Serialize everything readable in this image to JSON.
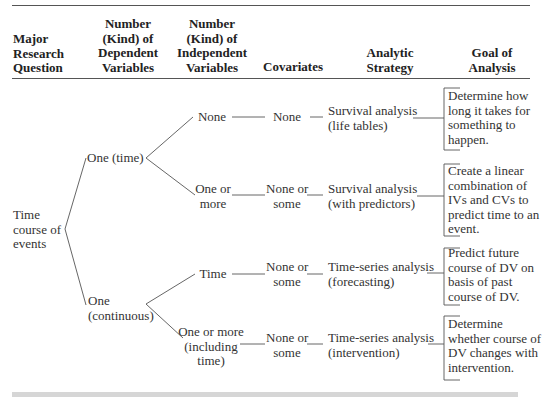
{
  "headers": {
    "question": [
      "Major",
      "Research",
      "Question"
    ],
    "dv": [
      "Number",
      "(Kind) of",
      "Dependent",
      "Variables"
    ],
    "iv": [
      "Number",
      "(Kind) of",
      "Independent",
      "Variables"
    ],
    "covariates": [
      "Covariates"
    ],
    "strategy": [
      "Analytic",
      "Strategy"
    ],
    "goal": [
      "Goal of",
      "Analysis"
    ]
  },
  "question": [
    "Time",
    "course of",
    "events"
  ],
  "dv_nodes": {
    "time": [
      "One (time)"
    ],
    "continuous": [
      "One",
      "(continuous)"
    ]
  },
  "rows": [
    {
      "iv": [
        "None"
      ],
      "covariates": [
        "None"
      ],
      "strategy": [
        "Survival analysis",
        "(life tables)"
      ],
      "goal": [
        "Determine how",
        "long it takes for",
        "something to",
        "happen."
      ]
    },
    {
      "iv": [
        "One or",
        "more"
      ],
      "covariates": [
        "None or",
        "some"
      ],
      "strategy": [
        "Survival analysis",
        "(with predictors)"
      ],
      "goal": [
        "Create a linear",
        "combination of",
        "IVs and CVs to",
        "predict time to an",
        "event."
      ]
    },
    {
      "iv": [
        "Time"
      ],
      "covariates": [
        "None or",
        "some"
      ],
      "strategy": [
        "Time-series analysis",
        "(forecasting)"
      ],
      "goal": [
        "Predict future",
        "course of DV on",
        "basis of past",
        "course of DV."
      ]
    },
    {
      "iv": [
        "One or more",
        "(including",
        "time)"
      ],
      "covariates": [
        "None or",
        "some"
      ],
      "strategy": [
        "Time-series analysis",
        "(intervention)"
      ],
      "goal": [
        "Determine",
        "whether course of",
        "DV changes with",
        "intervention."
      ]
    }
  ]
}
